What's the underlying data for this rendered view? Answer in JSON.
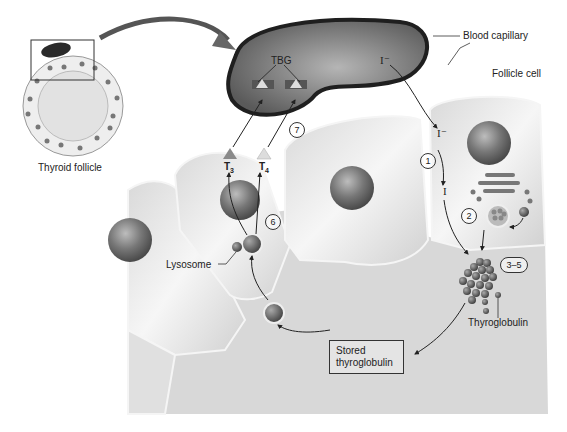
{
  "labels": {
    "blood_capillary": "Blood capillary",
    "follicle_cell": "Follicle cell",
    "thyroid_follicle": "Thyroid follicle",
    "tbg": "TBG",
    "lysosome": "Lysosome",
    "thyroglobulin": "Thyroglobulin",
    "stored_thyroglobulin_line1": "Stored",
    "stored_thyroglobulin_line2": "thyroglobulin",
    "iodide_capillary": "I⁻",
    "iodide_cell": "I⁻",
    "iodine": "I",
    "t3": "T",
    "t3_sub": "3",
    "t4": "T",
    "t4_sub": "4"
  },
  "steps": {
    "s1": "1",
    "s2": "2",
    "s3_5": "3–5",
    "s6": "6",
    "s7": "7"
  },
  "colors": {
    "background": "#ffffff",
    "capillary_border": "#1f1f1f",
    "capillary_fill": "#7a7a7a",
    "cell_fill": "#e8e8e8",
    "colloid_fill": "#d6d6d6",
    "nucleus": "#6e6e6e",
    "t3_triangle": "#8a8a8a",
    "t4_triangle": "#dcdcdc"
  }
}
